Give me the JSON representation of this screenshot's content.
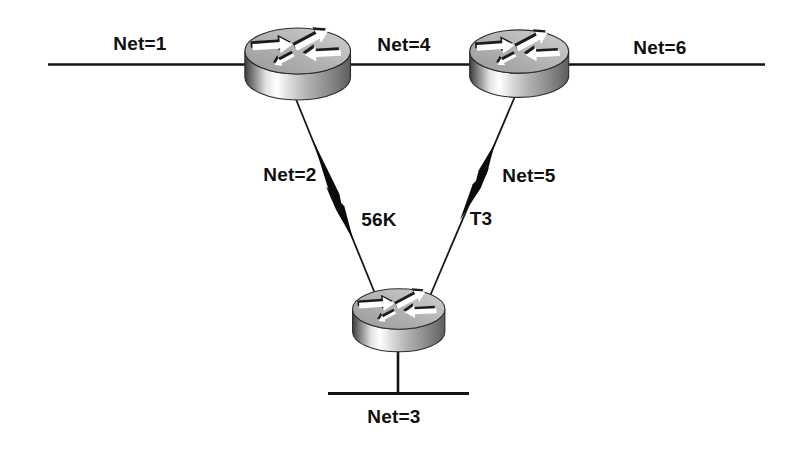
{
  "figure": {
    "kind": "network-topology-diagram",
    "background_color": "#ffffff",
    "ink_color": "#111111",
    "router_top_color": "#b2b2b2",
    "router_side_highlight": "#ffffff",
    "router_side_shadow": "#3a3a3a"
  },
  "labels": {
    "net1": "Net=1",
    "net4": "Net=4",
    "net6": "Net=6",
    "net2": "Net=2",
    "net5": "Net=5",
    "net3": "Net=3",
    "speed_56k": "56K",
    "speed_t3": "T3"
  },
  "topology": {
    "routers": [
      {
        "id": "router-top-left"
      },
      {
        "id": "router-top-right"
      },
      {
        "id": "router-bottom"
      }
    ],
    "segments": [
      {
        "label": "Net=1",
        "type": "backbone",
        "attached_to": "router-top-left"
      },
      {
        "label": "Net=4",
        "type": "backbone",
        "between": [
          "router-top-left",
          "router-top-right"
        ]
      },
      {
        "label": "Net=6",
        "type": "backbone",
        "attached_to": "router-top-right"
      },
      {
        "label": "Net=2",
        "type": "serial",
        "speed": "56K",
        "between": [
          "router-top-left",
          "router-bottom"
        ]
      },
      {
        "label": "Net=5",
        "type": "serial",
        "speed": "T3",
        "between": [
          "router-top-right",
          "router-bottom"
        ]
      },
      {
        "label": "Net=3",
        "type": "lan",
        "attached_to": "router-bottom"
      }
    ]
  }
}
